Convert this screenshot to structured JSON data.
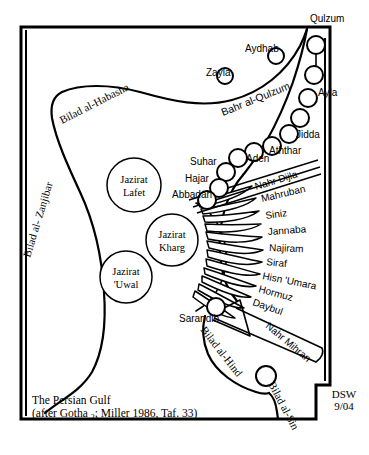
{
  "figure": {
    "title": "The Persian Gulf",
    "source_note": "(after Gotha ",
    "source_note_sub": "2",
    "source_note_tail": ";  Miller 1986, Taf. 33)",
    "credit_line1": "DSW",
    "credit_line2": "9/04"
  },
  "regions": [
    {
      "id": "zanjibar",
      "label": "Bilad al- Zanjibar"
    },
    {
      "id": "habasha",
      "label": "Bilad al-Habasha"
    },
    {
      "id": "hind",
      "label": "Bilad al-Hind"
    },
    {
      "id": "sin",
      "label": "Bilad al-Sin"
    }
  ],
  "seas": [
    {
      "id": "bahr-al-qulzum",
      "label": "Bahr al-Qulzum"
    }
  ],
  "rivers": [
    {
      "id": "nahr-dijla",
      "label": "Nahr Dijla"
    },
    {
      "id": "nahr-mihran",
      "label": "Nahr Mihran"
    }
  ],
  "islands": [
    {
      "id": "lafet",
      "line1": "Jazirat",
      "line2": "Lafet"
    },
    {
      "id": "kharg",
      "line1": "Jazirat",
      "line2": "Kharg"
    },
    {
      "id": "uwal",
      "line1": "Jazirat",
      "line2": "'Uwal"
    }
  ],
  "red_sea_ports": [
    {
      "id": "qulzum",
      "label": "Qulzum"
    },
    {
      "id": "ayla",
      "label": "Ayla"
    },
    {
      "id": "jidda",
      "label": "Jidda"
    },
    {
      "id": "aththar",
      "label": "Aththar"
    },
    {
      "id": "aydhab",
      "label": "Aydhab"
    },
    {
      "id": "zayla",
      "label": "Zayla"
    }
  ],
  "arabian_ports": [
    {
      "id": "aden",
      "label": "Aden"
    },
    {
      "id": "suhar",
      "label": "Suhar"
    },
    {
      "id": "hajar",
      "label": "Hajar"
    },
    {
      "id": "abbadan",
      "label": "Abbadan"
    }
  ],
  "gulf_ports": [
    {
      "id": "mahruban",
      "label": "Mahruban"
    },
    {
      "id": "siniz",
      "label": "Siniz"
    },
    {
      "id": "jannaba",
      "label": "Jannaba"
    },
    {
      "id": "najiram",
      "label": "Najiram"
    },
    {
      "id": "siraf",
      "label": "Siraf"
    },
    {
      "id": "hisn-umara",
      "label": "Hisn 'Umara"
    },
    {
      "id": "hormuz",
      "label": "Hormuz"
    },
    {
      "id": "daybul",
      "label": "Daybul"
    }
  ],
  "indian_ocean_ports": [
    {
      "id": "sarandib",
      "label": "Sarandib"
    }
  ],
  "colors": {
    "ink": "#000000",
    "paper": "#ffffff"
  }
}
